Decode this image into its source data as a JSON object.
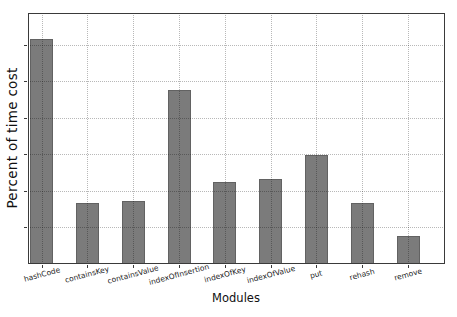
{
  "chart_data": {
    "type": "bar",
    "title": "",
    "xlabel": "Modules",
    "ylabel": "Percent of time cost",
    "categories": [
      "hashCode",
      "containsKey",
      "containsValue",
      "indexOfInsertion",
      "indexOfKey",
      "indexOfValue",
      "put",
      "rehash",
      "remove"
    ],
    "values": [
      24.6,
      6.7,
      6.9,
      19.1,
      9.0,
      9.3,
      11.9,
      6.7,
      3.1
    ],
    "ylim": [
      0,
      27.5
    ],
    "ytick_interval": 4,
    "ytick_labels_visible": false,
    "grid": "both-axes dotted, drawn over bars",
    "legend": "none",
    "bar_color": "#7b7b7b",
    "bar_edge_color": "#626262",
    "grid_color": "rgba(0,0,0,0.28)",
    "frame_color": "#3a3a3a",
    "text_color": "#1a1a1a"
  }
}
